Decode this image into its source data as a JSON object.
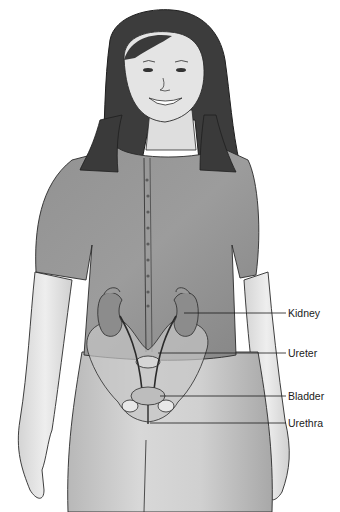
{
  "diagram": {
    "labels": [
      {
        "id": "kidney",
        "text": "Kidney",
        "x": 288,
        "y": 307,
        "line_from_x": 198,
        "line_y": 313
      },
      {
        "id": "ureter",
        "text": "Ureter",
        "x": 288,
        "y": 347,
        "line_from_x": 158,
        "line_y": 353
      },
      {
        "id": "bladder",
        "text": "Bladder",
        "x": 288,
        "y": 390,
        "line_from_x": 160,
        "line_y": 396
      },
      {
        "id": "urethra",
        "text": "Urethra",
        "x": 288,
        "y": 417,
        "line_from_x": 148,
        "line_y": 423
      }
    ],
    "colors": {
      "background": "#ffffff",
      "outline": "#2a2a2a",
      "hair": "#3a3a3a",
      "shirt": "#8e8e8e",
      "skin": "#e2e2e2",
      "pants": "#c9c9c9",
      "organ": "#8a8a8a",
      "pelvis": "#c4c4c4"
    }
  }
}
